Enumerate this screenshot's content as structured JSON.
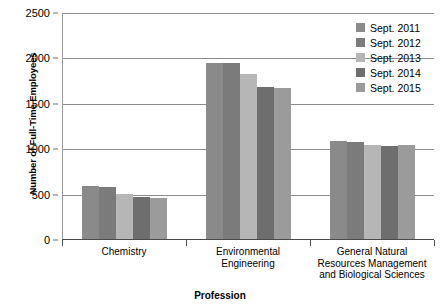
{
  "chart_data": {
    "type": "bar",
    "title": "",
    "xlabel": "Profession",
    "ylabel": "Number of Full-Time Employees",
    "categories": [
      "Chemistry",
      "Environmental Engineering",
      "General Natural Resources Management and Biological Sciences"
    ],
    "series": [
      {
        "name": "Sept. 2011",
        "color": "#8a8a8a",
        "values": [
          590,
          1950,
          1090
        ]
      },
      {
        "name": "Sept. 2012",
        "color": "#7b7b7b",
        "values": [
          585,
          1945,
          1075
        ]
      },
      {
        "name": "Sept. 2013",
        "color": "#b6b6b6",
        "values": [
          510,
          1830,
          1050
        ]
      },
      {
        "name": "Sept. 2014",
        "color": "#6e6e6e",
        "values": [
          475,
          1690,
          1035
        ]
      },
      {
        "name": "Sept. 2015",
        "color": "#9b9b9b",
        "values": [
          465,
          1670,
          1050
        ]
      }
    ],
    "ylim": [
      0,
      2500
    ],
    "yticks": [
      0,
      500,
      1000,
      1500,
      2000,
      2500
    ],
    "grid": true,
    "legend_position": "top-right"
  }
}
